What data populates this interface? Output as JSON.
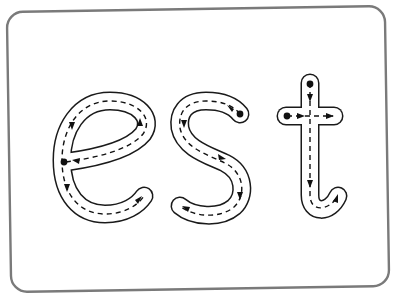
{
  "worksheet": {
    "title": "Letter tracing card",
    "word": "est",
    "letters": [
      {
        "char": "e",
        "strokes": 1,
        "start_points": 1
      },
      {
        "char": "s",
        "strokes": 1,
        "start_points": 1
      },
      {
        "char": "t",
        "strokes": 2,
        "start_points": 2
      }
    ],
    "style": {
      "card_border_color": "#7a7a7a",
      "outline_color": "#1a1a1a",
      "guide_color": "#111111",
      "background": "#ffffff"
    }
  }
}
